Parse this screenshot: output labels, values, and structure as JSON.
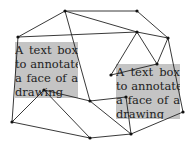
{
  "figure": {
    "background": "#ffffff",
    "box_color": "#c4c4c4",
    "edge_color": "#222222",
    "node_color": "#111111",
    "text_boxes": [
      {
        "id": "left",
        "x": 15,
        "y": 42,
        "w": 63,
        "h": 56,
        "lines": [
          "A text box",
          "to annotate",
          "a face of a",
          "drawing"
        ]
      },
      {
        "id": "right",
        "x": 116,
        "y": 64,
        "w": 64,
        "h": 55,
        "lines": [
          "A text box",
          "to annotate",
          "a face of a",
          "drawing"
        ]
      }
    ],
    "nodes": [
      {
        "id": "A",
        "x": 65,
        "y": 11
      },
      {
        "id": "B",
        "x": 137,
        "y": 11
      },
      {
        "id": "C",
        "x": 18,
        "y": 37
      },
      {
        "id": "D",
        "x": 137,
        "y": 32
      },
      {
        "id": "E",
        "x": 168,
        "y": 38
      },
      {
        "id": "F",
        "x": 157,
        "y": 64
      },
      {
        "id": "G",
        "x": 111,
        "y": 75
      },
      {
        "id": "H",
        "x": 44,
        "y": 90
      },
      {
        "id": "I",
        "x": 90,
        "y": 101
      },
      {
        "id": "J",
        "x": 126,
        "y": 97
      },
      {
        "id": "K",
        "x": 183,
        "y": 112
      },
      {
        "id": "L",
        "x": 12,
        "y": 122
      },
      {
        "id": "M",
        "x": 90,
        "y": 138
      },
      {
        "id": "N",
        "x": 131,
        "y": 134
      }
    ],
    "edges": [
      [
        "A",
        "B"
      ],
      [
        "A",
        "C"
      ],
      [
        "A",
        "D"
      ],
      [
        "A",
        "I"
      ],
      [
        "C",
        "D"
      ],
      [
        "C",
        "L"
      ],
      [
        "B",
        "E"
      ],
      [
        "D",
        "E"
      ],
      [
        "D",
        "G"
      ],
      [
        "D",
        "F"
      ],
      [
        "E",
        "F"
      ],
      [
        "E",
        "K"
      ],
      [
        "G",
        "F"
      ],
      [
        "H",
        "I"
      ],
      [
        "H",
        "L"
      ],
      [
        "H",
        "M"
      ],
      [
        "I",
        "J"
      ],
      [
        "I",
        "N"
      ],
      [
        "J",
        "N"
      ],
      [
        "L",
        "M"
      ],
      [
        "M",
        "N"
      ],
      [
        "N",
        "K"
      ]
    ]
  }
}
